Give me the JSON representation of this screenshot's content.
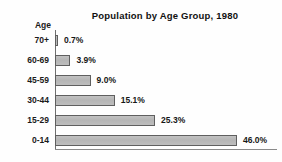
{
  "chart_data": {
    "type": "bar",
    "orientation": "horizontal",
    "title": "Population by Age Group, 1980",
    "xlabel": "",
    "ylabel": "Age",
    "categories": [
      "70+",
      "60-69",
      "45-59",
      "30-44",
      "15-29",
      "0-14"
    ],
    "values": [
      0.7,
      3.9,
      9.0,
      15.1,
      25.3,
      46.0
    ],
    "value_labels": [
      "0.7%",
      "3.9%",
      "9.0%",
      "15.1%",
      "25.3%",
      "46.0%"
    ],
    "unit": "%",
    "xlim": [
      0,
      46.0
    ],
    "grid": false,
    "legend": null,
    "bar_color": "#b9b9b9",
    "bar_border_color": "#5f5f5f",
    "axis_color": "#6f6f6f",
    "text_color": "#1a1a1a",
    "background_color": "#fefefe"
  },
  "chart": {
    "title": "Population by Age Group, 1980",
    "axis_caption": "Age",
    "bars": [
      {
        "category": "70+",
        "value_label": "0.7%",
        "value": 0.7
      },
      {
        "category": "60-69",
        "value_label": "3.9%",
        "value": 3.9
      },
      {
        "category": "45-59",
        "value_label": "9.0%",
        "value": 9.0
      },
      {
        "category": "30-44",
        "value_label": "15.1%",
        "value": 15.1
      },
      {
        "category": "15-29",
        "value_label": "25.3%",
        "value": 25.3
      },
      {
        "category": "0-14",
        "value_label": "46.0%",
        "value": 46.0
      }
    ]
  }
}
